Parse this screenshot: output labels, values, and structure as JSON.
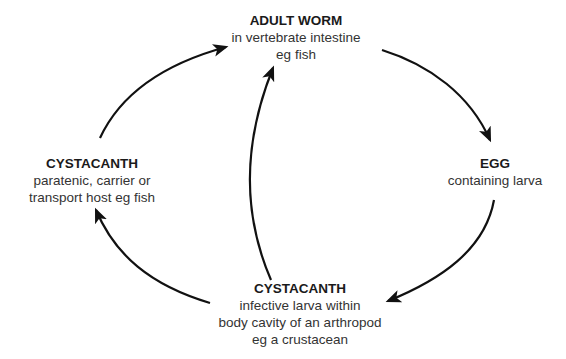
{
  "diagram": {
    "type": "life-cycle",
    "nodes": [
      {
        "id": "adult-worm",
        "title": "ADULT WORM",
        "lines": [
          "in vertebrate intestine",
          "eg fish"
        ]
      },
      {
        "id": "egg",
        "title": "EGG",
        "lines": [
          "containing larva"
        ]
      },
      {
        "id": "cystacanth-arthropod",
        "title": "CYSTACANTH",
        "lines": [
          "infective larva within",
          "body cavity of an arthropod",
          "eg a crustacean"
        ]
      },
      {
        "id": "cystacanth-paratenic",
        "title": "CYSTACANTH",
        "lines": [
          "paratenic, carrier or",
          "transport host eg fish"
        ]
      }
    ],
    "edges": [
      {
        "from": "adult-worm",
        "to": "egg"
      },
      {
        "from": "egg",
        "to": "cystacanth-arthropod"
      },
      {
        "from": "cystacanth-arthropod",
        "to": "cystacanth-paratenic"
      },
      {
        "from": "cystacanth-paratenic",
        "to": "adult-worm"
      },
      {
        "from": "cystacanth-arthropod",
        "to": "adult-worm"
      }
    ],
    "colors": {
      "arrow": "#111111",
      "text": "#222222",
      "background": "#ffffff"
    }
  }
}
